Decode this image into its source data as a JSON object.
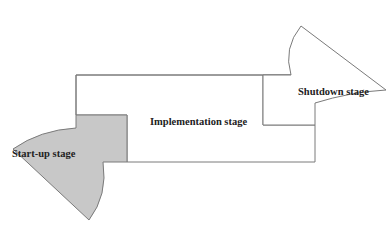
{
  "diagram": {
    "title": "",
    "stages": [
      {
        "id": "startup",
        "label": "Start-up stage",
        "fill": "#c8c8c8"
      },
      {
        "id": "implementation",
        "label": "Implementation stage",
        "fill": "#ffffff"
      },
      {
        "id": "shutdown",
        "label": "Shutdown stage",
        "fill": "#ffffff"
      }
    ],
    "colors": {
      "stroke": "#7a7a7a",
      "startup_fill": "#c8c8c8",
      "background": "#ffffff"
    }
  }
}
